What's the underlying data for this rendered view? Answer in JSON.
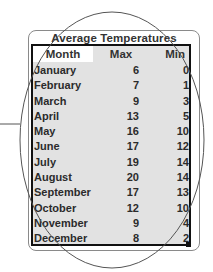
{
  "table": {
    "title": "Average Temperatures",
    "headers": {
      "month": "Month",
      "max": "Max",
      "min": "Min"
    },
    "rows": [
      {
        "month": "January",
        "max": "6",
        "min": "0"
      },
      {
        "month": "February",
        "max": "7",
        "min": "1"
      },
      {
        "month": "March",
        "max": "9",
        "min": "3"
      },
      {
        "month": "April",
        "max": "13",
        "min": "5"
      },
      {
        "month": "May",
        "max": "16",
        "min": "10"
      },
      {
        "month": "June",
        "max": "17",
        "min": "12"
      },
      {
        "month": "July",
        "max": "19",
        "min": "14"
      },
      {
        "month": "August",
        "max": "20",
        "min": "14"
      },
      {
        "month": "September",
        "max": "17",
        "min": "13"
      },
      {
        "month": "October",
        "max": "12",
        "min": "10"
      },
      {
        "month": "November",
        "max": "9",
        "min": "4"
      },
      {
        "month": "December",
        "max": "8",
        "min": "2"
      }
    ]
  },
  "colors": {
    "table_fill": "#e2e2e2",
    "border": "#111111",
    "overlay_line": "#555555"
  }
}
